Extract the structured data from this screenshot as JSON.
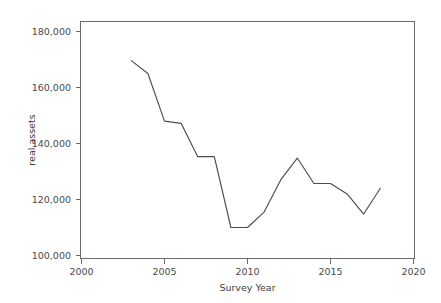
{
  "chart_data": {
    "type": "line",
    "title": "",
    "xlabel": "Survey Year",
    "ylabel": "real assets",
    "xlim": [
      2000,
      2020
    ],
    "ylim": [
      100000,
      180000
    ],
    "xticks": [
      2000,
      2005,
      2010,
      2015,
      2020
    ],
    "xtick_labels": [
      "2000",
      "2005",
      "2010",
      "2015",
      "2020"
    ],
    "yticks": [
      100000,
      120000,
      140000,
      160000,
      180000
    ],
    "ytick_labels": [
      "100,000",
      "120,000",
      "140,000",
      "160,000",
      "180,000"
    ],
    "grid": false,
    "legend": false,
    "legend_position": "none",
    "line_color": "#4d4d52",
    "axis_color": "#6b6b6b",
    "background_color": "#ffffff",
    "x": [
      2003,
      2004,
      2005,
      2006,
      2007,
      2008,
      2009,
      2010,
      2011,
      2012,
      2013,
      2014,
      2015,
      2016,
      2017,
      2018
    ],
    "values": [
      169600,
      165000,
      148000,
      147200,
      135300,
      135300,
      110000,
      110000,
      115500,
      127000,
      134800,
      125700,
      125700,
      122000,
      114800,
      124000
    ],
    "series": [
      {
        "name": "real assets",
        "values": [
          169600,
          165000,
          148000,
          147200,
          135300,
          135300,
          110000,
          110000,
          115500,
          127000,
          134800,
          125700,
          125700,
          122000,
          114800,
          124000
        ]
      }
    ]
  }
}
